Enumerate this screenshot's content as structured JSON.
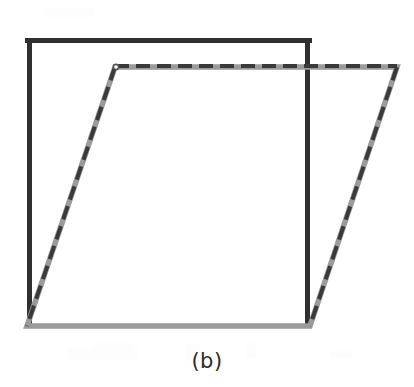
{
  "figure": {
    "caption": "(b)",
    "panel_letter": "b",
    "background_color": "#ffffff",
    "width": 414,
    "height": 387
  },
  "shapes": {
    "square": {
      "name": "solid-square",
      "style": "solid",
      "stroke_color": "#2f2f2f",
      "thick_stroke_width": 5,
      "thin_stroke_width": 2,
      "vertices": [
        {
          "label": "top-left",
          "x": 27,
          "y": 38
        },
        {
          "label": "top-right",
          "x": 310,
          "y": 38
        },
        {
          "label": "bottom-right",
          "x": 310,
          "y": 326
        },
        {
          "label": "bottom-left",
          "x": 27,
          "y": 326
        }
      ]
    },
    "parallelogram": {
      "name": "dashed-parallelogram",
      "style": "dashed",
      "stroke_color": "#3a3a3a",
      "underlay_color": "#9b9b9b",
      "stroke_width": 5,
      "dash_pattern": "14 7",
      "vertices": [
        {
          "label": "top-left",
          "x": 115,
          "y": 67
        },
        {
          "label": "top-right",
          "x": 397,
          "y": 67
        },
        {
          "label": "bottom-right",
          "x": 310,
          "y": 326
        },
        {
          "label": "bottom-left",
          "x": 27,
          "y": 326
        }
      ]
    }
  },
  "chart_data": {
    "type": "scatter",
    "title": "(b)",
    "xlabel": "",
    "ylabel": "",
    "series": [
      {
        "name": "solid-square",
        "linestyle": "solid",
        "color": "#2f2f2f",
        "x": [
          27,
          310,
          310,
          27,
          27
        ],
        "y": [
          38,
          38,
          326,
          326,
          38
        ]
      },
      {
        "name": "dashed-parallelogram",
        "linestyle": "dashed",
        "color": "#3a3a3a",
        "x": [
          115,
          397,
          310,
          27,
          115
        ],
        "y": [
          67,
          67,
          326,
          326,
          67
        ]
      }
    ],
    "xlim": [
      0,
      414
    ],
    "ylim": [
      387,
      0
    ],
    "grid": false,
    "legend": "none"
  }
}
